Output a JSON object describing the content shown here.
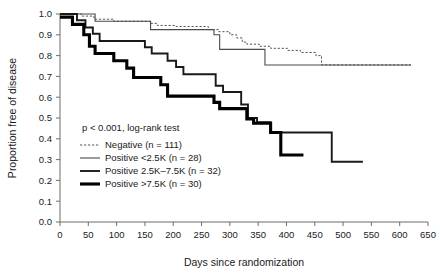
{
  "chart_data": {
    "type": "line",
    "title": "",
    "xlabel": "Days since randomization",
    "ylabel": "Proportion free of disease",
    "xlim": [
      0,
      650
    ],
    "ylim": [
      0.0,
      1.0
    ],
    "xticks": [
      0,
      50,
      100,
      150,
      200,
      250,
      300,
      350,
      400,
      450,
      500,
      550,
      600,
      650
    ],
    "xtick_labels": [
      "0",
      "50",
      "100",
      "150",
      "200",
      "250",
      "300",
      "350",
      "400",
      "450",
      "500",
      "550",
      "600",
      "650"
    ],
    "yticks": [
      0.0,
      0.1,
      0.2,
      0.3,
      0.4,
      0.5,
      0.6,
      0.7,
      0.8,
      0.9,
      1.0
    ],
    "ytick_labels": [
      "0.0",
      "0.1",
      "0.2",
      "0.3",
      "0.4",
      "0.5",
      "0.6",
      "0.7",
      "0.8",
      "0.9",
      "1.0"
    ],
    "grid": false,
    "legend_position": "center-left",
    "annotation": "p < 0.001, log-rank test",
    "series": [
      {
        "name": "Negative (n = 111)",
        "style": "dashed",
        "weight": "thin",
        "n": 111,
        "final_value": 0.75,
        "points": [
          [
            0,
            1.0
          ],
          [
            38,
            1.0
          ],
          [
            38,
            0.99
          ],
          [
            60,
            0.99
          ],
          [
            60,
            0.975
          ],
          [
            95,
            0.975
          ],
          [
            95,
            0.965
          ],
          [
            160,
            0.965
          ],
          [
            160,
            0.955
          ],
          [
            172,
            0.955
          ],
          [
            172,
            0.945
          ],
          [
            205,
            0.945
          ],
          [
            205,
            0.94
          ],
          [
            262,
            0.94
          ],
          [
            262,
            0.925
          ],
          [
            280,
            0.925
          ],
          [
            280,
            0.915
          ],
          [
            300,
            0.915
          ],
          [
            300,
            0.9
          ],
          [
            312,
            0.9
          ],
          [
            312,
            0.885
          ],
          [
            322,
            0.885
          ],
          [
            322,
            0.865
          ],
          [
            330,
            0.865
          ],
          [
            330,
            0.855
          ],
          [
            352,
            0.855
          ],
          [
            352,
            0.845
          ],
          [
            372,
            0.845
          ],
          [
            372,
            0.835
          ],
          [
            402,
            0.835
          ],
          [
            402,
            0.825
          ],
          [
            425,
            0.825
          ],
          [
            425,
            0.815
          ],
          [
            452,
            0.815
          ],
          [
            452,
            0.8
          ],
          [
            462,
            0.8
          ],
          [
            462,
            0.755
          ],
          [
            620,
            0.755
          ]
        ]
      },
      {
        "name": "Positive <2.5K (n = 28)",
        "style": "solid",
        "weight": "thin",
        "n": 28,
        "final_value": 0.75,
        "points": [
          [
            0,
            1.0
          ],
          [
            62,
            1.0
          ],
          [
            62,
            0.965
          ],
          [
            160,
            0.965
          ],
          [
            160,
            0.925
          ],
          [
            272,
            0.925
          ],
          [
            272,
            0.9
          ],
          [
            282,
            0.9
          ],
          [
            282,
            0.83
          ],
          [
            362,
            0.83
          ],
          [
            362,
            0.755
          ],
          [
            620,
            0.755
          ]
        ]
      },
      {
        "name": "Positive 2.5K-7.5K (n = 32)",
        "style": "solid",
        "weight": "medium",
        "n": 32,
        "final_value": 0.29,
        "points": [
          [
            0,
            1.0
          ],
          [
            30,
            1.0
          ],
          [
            30,
            0.97
          ],
          [
            45,
            0.97
          ],
          [
            45,
            0.935
          ],
          [
            58,
            0.935
          ],
          [
            58,
            0.905
          ],
          [
            70,
            0.905
          ],
          [
            70,
            0.87
          ],
          [
            150,
            0.87
          ],
          [
            150,
            0.84
          ],
          [
            162,
            0.84
          ],
          [
            162,
            0.81
          ],
          [
            190,
            0.81
          ],
          [
            190,
            0.775
          ],
          [
            205,
            0.775
          ],
          [
            205,
            0.745
          ],
          [
            218,
            0.745
          ],
          [
            218,
            0.71
          ],
          [
            275,
            0.71
          ],
          [
            275,
            0.655
          ],
          [
            288,
            0.655
          ],
          [
            288,
            0.625
          ],
          [
            320,
            0.625
          ],
          [
            320,
            0.565
          ],
          [
            332,
            0.565
          ],
          [
            332,
            0.5
          ],
          [
            348,
            0.5
          ],
          [
            348,
            0.48
          ],
          [
            372,
            0.48
          ],
          [
            372,
            0.43
          ],
          [
            480,
            0.43
          ],
          [
            480,
            0.29
          ],
          [
            535,
            0.29
          ]
        ]
      },
      {
        "name": "Positive >7.5K (n = 30)",
        "style": "solid",
        "weight": "thick",
        "n": 30,
        "final_value": 0.32,
        "points": [
          [
            0,
            0.985
          ],
          [
            22,
            0.985
          ],
          [
            22,
            0.95
          ],
          [
            42,
            0.95
          ],
          [
            42,
            0.9
          ],
          [
            52,
            0.9
          ],
          [
            52,
            0.845
          ],
          [
            62,
            0.845
          ],
          [
            62,
            0.81
          ],
          [
            95,
            0.81
          ],
          [
            95,
            0.775
          ],
          [
            118,
            0.775
          ],
          [
            118,
            0.74
          ],
          [
            130,
            0.74
          ],
          [
            130,
            0.695
          ],
          [
            178,
            0.695
          ],
          [
            178,
            0.66
          ],
          [
            190,
            0.66
          ],
          [
            190,
            0.605
          ],
          [
            272,
            0.605
          ],
          [
            272,
            0.575
          ],
          [
            282,
            0.575
          ],
          [
            282,
            0.545
          ],
          [
            330,
            0.545
          ],
          [
            330,
            0.495
          ],
          [
            342,
            0.495
          ],
          [
            342,
            0.475
          ],
          [
            372,
            0.475
          ],
          [
            372,
            0.43
          ],
          [
            390,
            0.43
          ],
          [
            390,
            0.322
          ],
          [
            430,
            0.322
          ]
        ]
      }
    ]
  },
  "legend": {
    "items": [
      {
        "label": "Negative (n = 111)"
      },
      {
        "label": "Positive <2.5K (n = 28)"
      },
      {
        "label": "Positive 2.5K–7.5K (n = 32)"
      },
      {
        "label": "Positive >7.5K (n = 30)"
      }
    ]
  },
  "statistics": {
    "p_value_text": "p < 0.001, log-rank test"
  },
  "axes": {
    "x_title": "Days since randomization",
    "y_title": "Proportion free of disease"
  },
  "colors": {
    "negative": "#555555",
    "positive_low": "#4a4a4a",
    "positive_mid": "#1a1a1a",
    "positive_high": "#000000",
    "axis": "#6d6d6d",
    "text": "#1a1a1a",
    "background": "#ffffff"
  }
}
